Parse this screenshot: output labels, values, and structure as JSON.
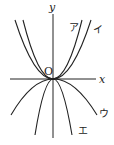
{
  "diagram": {
    "type": "parabolas-through-origin",
    "axes": {
      "x_label": "x",
      "y_label": "y",
      "origin_label": "O"
    },
    "curves": [
      {
        "id": "a",
        "label": "ア",
        "direction": "up",
        "width": "narrow"
      },
      {
        "id": "i",
        "label": "イ",
        "direction": "up",
        "width": "wide"
      },
      {
        "id": "u",
        "label": "ウ",
        "direction": "down",
        "width": "wide"
      },
      {
        "id": "e",
        "label": "エ",
        "direction": "down",
        "width": "narrow"
      }
    ]
  }
}
